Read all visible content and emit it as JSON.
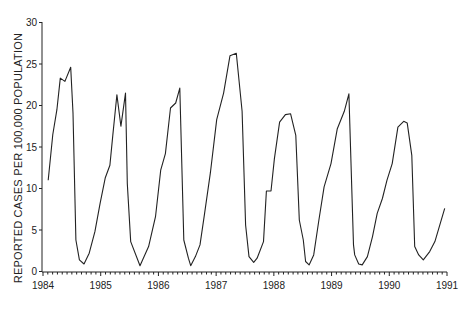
{
  "chart_data": {
    "type": "line",
    "title": "",
    "xlabel": "",
    "ylabel": "REPORTED CASES PER 100,000 POPULATION",
    "ylim": [
      0,
      30
    ],
    "xlim": [
      1984,
      1991
    ],
    "grid": false,
    "legend": null,
    "x_ticks": [
      "1984",
      "1985",
      "1986",
      "1987",
      "1988",
      "1989",
      "1990",
      "1991"
    ],
    "y_ticks": [
      "0",
      "5",
      "10",
      "15",
      "20",
      "25",
      "30"
    ],
    "x_minor_ticks": "monthly",
    "series": [
      {
        "name": "Reported cases",
        "color": "#222222",
        "x": [
          1984.09,
          1984.17,
          1984.24,
          1984.3,
          1984.38,
          1984.48,
          1984.52,
          1984.57,
          1984.63,
          1984.71,
          1984.8,
          1984.9,
          1984.99,
          1985.08,
          1985.16,
          1985.21,
          1985.28,
          1985.35,
          1985.43,
          1985.46,
          1985.52,
          1985.68,
          1985.83,
          1985.95,
          1986.04,
          1986.12,
          1986.21,
          1986.3,
          1986.37,
          1986.44,
          1986.52,
          1986.56,
          1986.64,
          1986.72,
          1986.8,
          1986.9,
          1987.01,
          1987.13,
          1987.24,
          1987.35,
          1987.45,
          1987.51,
          1987.57,
          1987.65,
          1987.71,
          1987.82,
          1987.87,
          1887.95,
          1988.01,
          1988.1,
          1988.2,
          1988.29,
          1988.38,
          1988.44,
          1988.51,
          1988.55,
          1988.61,
          1988.69,
          1988.78,
          1988.87,
          1988.99,
          1989.1,
          1989.22,
          1989.3,
          1989.38,
          1989.4,
          1989.47,
          1989.53,
          1989.62,
          1989.71,
          1989.79,
          1989.88,
          1989.96,
          1990.05,
          1990.15,
          1990.25,
          1990.31,
          1990.39,
          1990.44,
          1990.51,
          1990.59,
          1990.7,
          1990.79,
          1990.96
        ],
        "values": [
          11.0,
          16.5,
          19.5,
          23.3,
          22.9,
          24.6,
          19.1,
          3.8,
          1.4,
          0.9,
          2.2,
          4.8,
          8.2,
          11.3,
          12.8,
          16.4,
          21.3,
          17.5,
          21.5,
          10.6,
          3.6,
          0.7,
          3.0,
          6.6,
          12.2,
          14.2,
          19.7,
          20.3,
          22.1,
          3.8,
          1.6,
          0.7,
          1.8,
          3.2,
          7.0,
          11.9,
          18.3,
          21.5,
          26.0,
          26.3,
          19.3,
          5.6,
          1.8,
          1.1,
          1.6,
          3.6,
          9.7,
          9.7,
          13.6,
          18.0,
          18.9,
          19.0,
          16.4,
          6.2,
          3.8,
          1.2,
          0.8,
          2.0,
          6.2,
          10.2,
          13.0,
          17.2,
          19.3,
          21.4,
          3.2,
          2.0,
          0.9,
          0.8,
          1.8,
          4.2,
          7.0,
          8.8,
          11.0,
          13.0,
          17.4,
          18.1,
          17.9,
          14.0,
          3.0,
          2.0,
          1.4,
          2.4,
          3.6,
          7.6
        ]
      }
    ]
  }
}
